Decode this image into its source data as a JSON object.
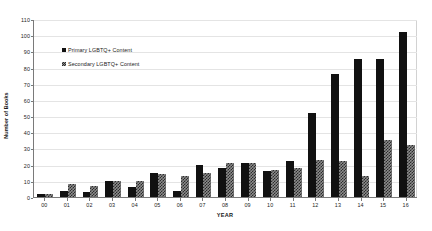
{
  "chart_data": {
    "type": "bar",
    "title": "",
    "xlabel": "YEAR",
    "ylabel": "Number of Books",
    "ylim": [
      0,
      110
    ],
    "yticks": [
      0,
      10,
      20,
      30,
      40,
      50,
      60,
      70,
      80,
      90,
      100,
      110
    ],
    "grid": true,
    "legend_position": "upper-left-inside",
    "categories": [
      "00",
      "01",
      "02",
      "03",
      "04",
      "05",
      "06",
      "07",
      "08",
      "09",
      "10",
      "11",
      "12",
      "13",
      "14",
      "15",
      "16"
    ],
    "series": [
      {
        "name": "Primary LGBTQ+ Content",
        "color": "#111111",
        "values": [
          2,
          4,
          3,
          10,
          6,
          15,
          4,
          20,
          18,
          21,
          16,
          22,
          52,
          76,
          85,
          85,
          102
        ]
      },
      {
        "name": "Secondary LGBTQ+ Content",
        "color": "#8c8c8c",
        "values": [
          2,
          8,
          7,
          10,
          10,
          14,
          13,
          15,
          21,
          21,
          17,
          18,
          23,
          22,
          13,
          35,
          32
        ]
      }
    ]
  },
  "legend": {
    "entries": [
      {
        "label": "Primary LGBTQ+ Content"
      },
      {
        "label": "Secondary LGBTQ+ Content"
      }
    ]
  },
  "axes": {
    "x_title": "YEAR",
    "y_title": "Number of Books"
  }
}
